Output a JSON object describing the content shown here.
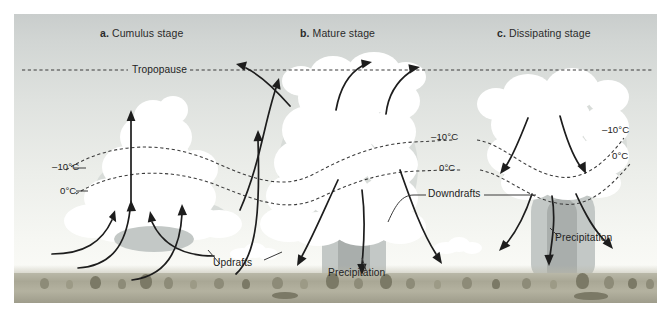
{
  "figure": {
    "kind": "thunderstorm-life-cycle-diagram",
    "background_colors": {
      "sky_top": "#c9cdcc",
      "sky_bottom": "#fbfbf7",
      "ground": "#a9a795",
      "cloud": "#ffffff",
      "cloud_shadow": "#c3c8c6",
      "line": "#1d1d1d"
    }
  },
  "panels": [
    {
      "letter": "a.",
      "name": "Cumulus stage"
    },
    {
      "letter": "b.",
      "name": "Mature stage"
    },
    {
      "letter": "c.",
      "name": "Dissipating stage"
    }
  ],
  "annotations": {
    "tropopause": "Tropopause",
    "temp_minus10": "–10°C",
    "temp_zero": "0°C",
    "updrafts": "Updrafts",
    "downdrafts": "Downdrafts",
    "precipitation": "Precipitation"
  },
  "labels": {
    "left_minus10": "–10°C",
    "left_zero": "0°C",
    "mid_minus10": "–10°C",
    "mid_zero": "0°C",
    "right_minus10": "–10°C",
    "right_zero": "0°C",
    "updrafts": "Updrafts",
    "downdrafts": "Downdrafts",
    "precip_mature": "Precipitation",
    "precip_dissipating": "Precipitation",
    "tropopause": "Tropopause"
  }
}
